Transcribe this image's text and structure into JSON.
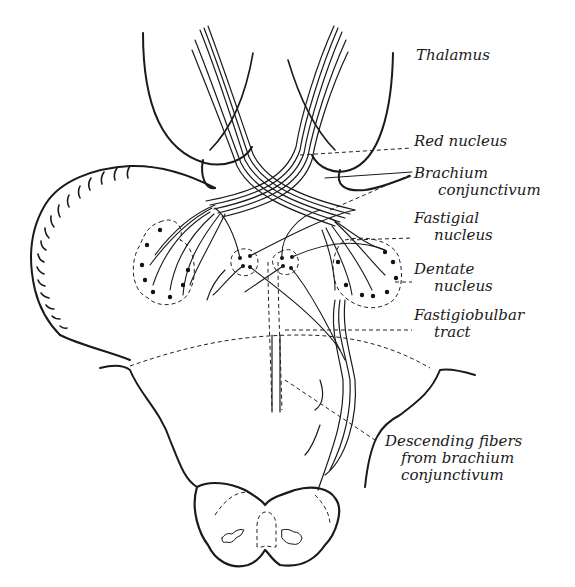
{
  "diagram": {
    "ink_color": "#1a1a1a",
    "background": "#ffffff",
    "labels": [
      {
        "id": "thalamus",
        "lines": [
          "Thalamus"
        ]
      },
      {
        "id": "red-nucleus",
        "lines": [
          "Red nucleus"
        ]
      },
      {
        "id": "brachium-conjunctivum",
        "lines": [
          "Brachium",
          "conjunctivum"
        ]
      },
      {
        "id": "fastigial-nucleus",
        "lines": [
          "Fastigial",
          "nucleus"
        ]
      },
      {
        "id": "dentate-nucleus",
        "lines": [
          "Dentate",
          "nucleus"
        ]
      },
      {
        "id": "fastigiobulbar-tract",
        "lines": [
          "Fastigiobulbar",
          "tract"
        ]
      },
      {
        "id": "descending-fibers",
        "lines": [
          "Descending fibers",
          "from brachium",
          "conjunctivum"
        ]
      }
    ]
  }
}
